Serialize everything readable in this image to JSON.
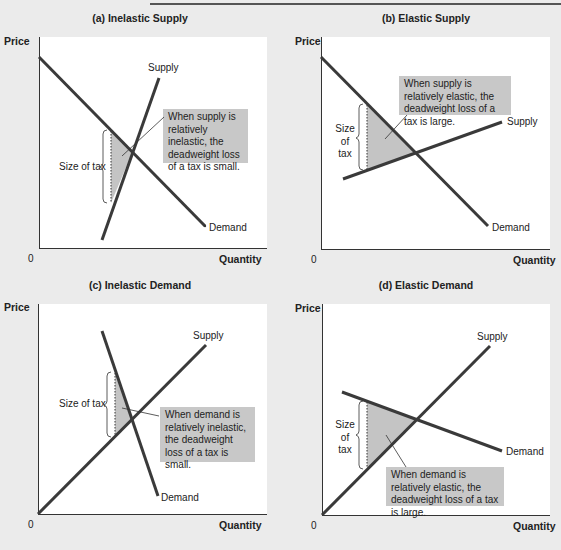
{
  "figure": {
    "panels": [
      {
        "id": "a",
        "title": "(a) Inelastic Supply",
        "y_axis_label": "Price",
        "x_axis_label": "Quantity",
        "origin_label": "0",
        "supply_label": "Supply",
        "demand_label": "Demand",
        "tax_label": "Size of tax",
        "callout": "When supply is relatively inelastic, the deadweight loss of a tax is small."
      },
      {
        "id": "b",
        "title": "(b) Elastic Supply",
        "y_axis_label": "Price",
        "x_axis_label": "Quantity",
        "origin_label": "0",
        "supply_label": "Supply",
        "demand_label": "Demand",
        "tax_label_lines": [
          "Size",
          "of",
          "tax"
        ],
        "callout": "When supply is relatively elastic, the deadweight loss of a tax is large."
      },
      {
        "id": "c",
        "title": "(c) Inelastic Demand",
        "y_axis_label": "Price",
        "x_axis_label": "Quantity",
        "origin_label": "0",
        "supply_label": "Supply",
        "demand_label": "Demand",
        "tax_label": "Size of tax",
        "callout": "When demand is relatively inelastic, the deadweight loss of a tax is small."
      },
      {
        "id": "d",
        "title": "(d) Elastic Demand",
        "y_axis_label": "Price",
        "x_axis_label": "Quantity",
        "origin_label": "0",
        "supply_label": "Supply",
        "demand_label": "Demand",
        "tax_label_lines": [
          "Size",
          "of",
          "tax"
        ],
        "callout": "When demand is relatively elastic, the deadweight loss of a tax is large."
      }
    ],
    "colors": {
      "background": "#ebebeb",
      "plot_area": "#ffffff",
      "curve": "#3a3a3a",
      "deadweight_loss": "#c4c4c4",
      "callout_box": "#c8c8c8"
    }
  }
}
